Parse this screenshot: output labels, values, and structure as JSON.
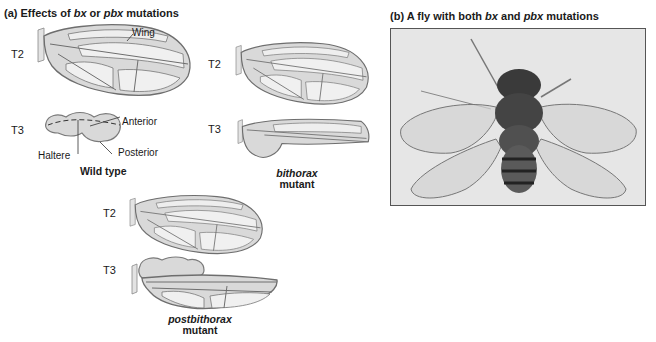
{
  "panel_a": {
    "title_prefix": "(a) Effects of ",
    "title_gene1": "bx",
    "title_mid": " or ",
    "title_gene2": "pbx",
    "title_suffix": " mutations",
    "wild_type": {
      "seg_t2": "T2",
      "seg_t3": "T3",
      "label_wing": "Wing",
      "label_anterior": "Anterior",
      "label_posterior": "Posterior",
      "label_haltere": "Haltere",
      "caption": "Wild type"
    },
    "bithorax": {
      "seg_t2": "T2",
      "seg_t3": "T3",
      "caption_italic": "bithorax",
      "caption_rest": "mutant"
    },
    "postbithorax": {
      "seg_t2": "T2",
      "seg_t3": "T3",
      "caption_italic": "postbithorax",
      "caption_rest": "mutant"
    }
  },
  "panel_b": {
    "title_prefix": "(b) A fly with both ",
    "title_gene1": "bx",
    "title_mid": " and ",
    "title_gene2": "pbx",
    "title_suffix": " mutations"
  },
  "colors": {
    "wing_fill": "#d9d9d9",
    "wing_cell": "#eeeeee",
    "vein": "#6e6e6e",
    "photo_bg": "#e6e6e6",
    "fly_body": "#3a3a3a"
  }
}
